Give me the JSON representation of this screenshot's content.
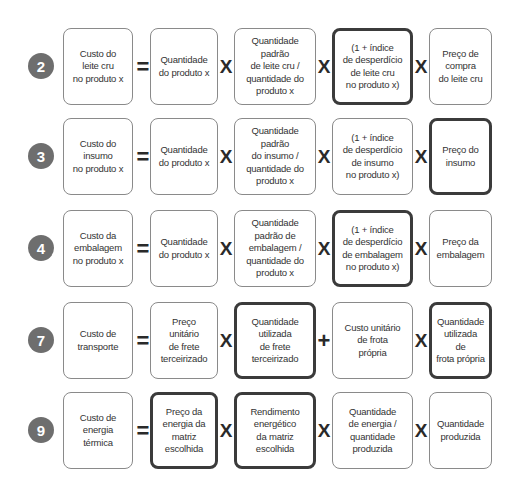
{
  "colors": {
    "badge": "#6e6e6e",
    "box_border": "#8a8a8a",
    "highlight_border": "#3b3b3b",
    "text": "#333333"
  },
  "rows": [
    {
      "number": "2",
      "result": "Custo do\nleite cru\nno produto x",
      "terms": [
        {
          "op": "=",
          "label": "Quantidade\ndo produto x",
          "highlight": false
        },
        {
          "op": "X",
          "label": "Quantidade\npadrão\nde leite cru /\nquantidade do\nproduto x",
          "highlight": false
        },
        {
          "op": "X",
          "label": "(1 + índice\nde desperdício\nde leite cru\nno produto x)",
          "highlight": true
        },
        {
          "op": "X",
          "label": "Preço de\ncompra\ndo leite cru",
          "highlight": false
        }
      ]
    },
    {
      "number": "3",
      "result": "Custo do\ninsumo\nno produto x",
      "terms": [
        {
          "op": "=",
          "label": "Quantidade\ndo produto x",
          "highlight": false
        },
        {
          "op": "X",
          "label": "Quantidade\npadrão\ndo insumo /\nquantidade do\nproduto x",
          "highlight": false
        },
        {
          "op": "X",
          "label": "(1 + índice\nde desperdício\nde insumo\nno produto x)",
          "highlight": false
        },
        {
          "op": "X",
          "label": "Preço do\ninsumo",
          "highlight": true
        }
      ]
    },
    {
      "number": "4",
      "result": "Custo da\nembalagem\nno produto x",
      "terms": [
        {
          "op": "=",
          "label": "Quantidade\ndo produto x",
          "highlight": false
        },
        {
          "op": "X",
          "label": "Quantidade\npadrão de\nembalagem /\nquantidade do\nproduto x",
          "highlight": false
        },
        {
          "op": "X",
          "label": "(1 + índice\nde desperdício\nde embalagem\nno produto x)",
          "highlight": true
        },
        {
          "op": "X",
          "label": "Preço da\nembalagem",
          "highlight": false
        }
      ]
    },
    {
      "number": "7",
      "result": "Custo de\ntransporte",
      "terms": [
        {
          "op": "=",
          "label": "Preço\nunitário\nde frete\nterceirizado",
          "highlight": false
        },
        {
          "op": "X",
          "label": "Quantidade\nutilizada\nde frete\nterceirizado",
          "highlight": true
        },
        {
          "op": "+",
          "label": "Custo unitário\nde frota\nprópria",
          "highlight": false
        },
        {
          "op": "X",
          "label": "Quantidade\nutilizada\nde\nfrota própria",
          "highlight": true
        }
      ]
    },
    {
      "number": "9",
      "result": "Custo de\nenergia\ntérmica",
      "terms": [
        {
          "op": "=",
          "label": "Preço da\nenergia da\nmatriz\nescolhida",
          "highlight": true
        },
        {
          "op": "X",
          "label": "Rendimento\nenergético\nda matriz\nescolhida",
          "highlight": true
        },
        {
          "op": "X",
          "label": "Quantidade\nde energia /\nquantidade\nproduzida",
          "highlight": false
        },
        {
          "op": "X",
          "label": "Quantidade\nproduzida",
          "highlight": false
        }
      ]
    }
  ]
}
